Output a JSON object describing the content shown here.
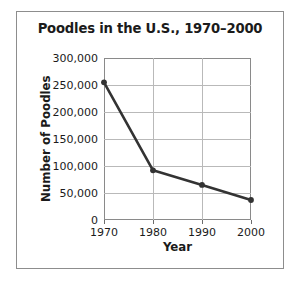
{
  "chart_data": {
    "type": "line",
    "title": "Poodles in the U.S., 1970–2000",
    "xlabel": "Year",
    "ylabel": "Number of Poodles",
    "x": [
      1970,
      1980,
      1990,
      2000
    ],
    "values": [
      255000,
      92000,
      65000,
      37000
    ],
    "series": [
      {
        "name": "Number of Poodles",
        "values": [
          255000,
          92000,
          65000,
          37000
        ]
      }
    ],
    "xlim": [
      1970,
      2000
    ],
    "ylim": [
      0,
      300000
    ],
    "xticks": [
      "1970",
      "1980",
      "1990",
      "2000"
    ],
    "yticks": [
      "0",
      "50,000",
      "100,000",
      "150,000",
      "200,000",
      "250,000",
      "300,000"
    ],
    "ytick_values": [
      0,
      50000,
      100000,
      150000,
      200000,
      250000,
      300000
    ],
    "grid": true,
    "legend": null,
    "legend_position": "none",
    "marker": "circle",
    "line_color": "#333333",
    "marker_color": "#333333",
    "grid_color": "#b9b9b9",
    "axis_color": "#8a8a8a",
    "text_color": "#1b1b1b",
    "background_color": "#ffffff"
  }
}
